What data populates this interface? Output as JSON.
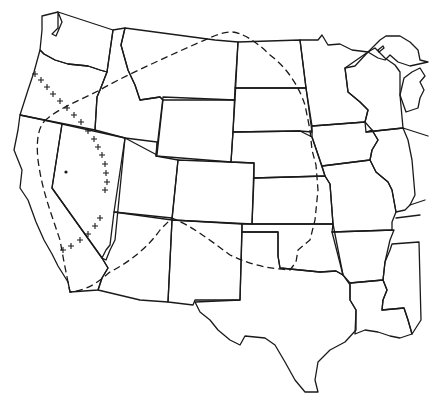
{
  "map": {
    "region": "Western and Central United States",
    "style": "black line art on white",
    "colors": {
      "background": "#ffffff",
      "line": "#1a1a1a"
    },
    "legend": {
      "state_boundaries": "solid line",
      "range_boundary": "dashed line",
      "cross_markers": "+ markers",
      "point_marker": "* marker"
    },
    "features": {
      "state_outlines": [
        "WA",
        "OR",
        "CA",
        "ID",
        "NV",
        "MT",
        "WY",
        "UT",
        "AZ",
        "CO",
        "NM",
        "ND",
        "SD",
        "NE",
        "KS",
        "OK",
        "TX",
        "MN",
        "IA",
        "MO",
        "AR",
        "LA",
        "WI",
        "IL",
        "MI",
        "MS"
      ],
      "dashed_boundary": "loop enclosing the Great Basin and Great Plains, from northern California through Montana and the Dakotas to central Oklahoma, then west across New Mexico and Arizona to southern California",
      "cross_line": "line of + markers running from western Oregon southeast along the Sierra Nevada to southern California",
      "cross_count": 22,
      "star_marker": "single * in western Nevada"
    }
  }
}
